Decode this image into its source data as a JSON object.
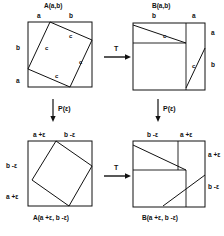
{
  "figure": {
    "title": "",
    "stroke_color": "#111111",
    "background": "#ffffff"
  },
  "panels": [
    {
      "id": "top-left",
      "caption": "A(a,b)",
      "caption_position": "above",
      "edge_labels": [
        {
          "text": "a",
          "side": "top-left"
        },
        {
          "text": "b",
          "side": "top-right"
        },
        {
          "text": "b",
          "side": "left-upper"
        },
        {
          "text": "a",
          "side": "left-lower"
        }
      ],
      "inner_labels": [
        {
          "text": "c"
        },
        {
          "text": "c"
        },
        {
          "text": "c"
        },
        {
          "text": "c"
        }
      ],
      "shape": "square-with-inscribed-tilted-square"
    },
    {
      "id": "top-right",
      "caption": "B(a,b)",
      "caption_position": "above",
      "edge_labels": [
        {
          "text": "b",
          "side": "top-left"
        },
        {
          "text": "a",
          "side": "top-right"
        },
        {
          "text": "a",
          "side": "right-upper"
        },
        {
          "text": "b",
          "side": "right-lower"
        }
      ],
      "inner_labels": [
        {
          "text": "c"
        },
        {
          "text": "c"
        }
      ],
      "shape": "square-with-two-right-triangles"
    },
    {
      "id": "bottom-left",
      "caption": "A(a +ε, b -ε)",
      "caption_position": "below",
      "edge_labels": [
        {
          "text": "a +ε",
          "side": "top-left"
        },
        {
          "text": "b -ε",
          "side": "top-right"
        },
        {
          "text": "b -ε",
          "side": "left-upper"
        },
        {
          "text": "a +ε",
          "side": "left-lower"
        }
      ],
      "inner_labels": [],
      "shape": "square-with-inscribed-tilted-square"
    },
    {
      "id": "bottom-right",
      "caption": "B(a +ε, b -ε)",
      "caption_position": "below",
      "edge_labels": [
        {
          "text": "b -ε",
          "side": "top-left"
        },
        {
          "text": "a +ε",
          "side": "top-right"
        },
        {
          "text": "a +ε",
          "side": "right-upper"
        },
        {
          "text": "b -ε",
          "side": "right-lower"
        }
      ],
      "inner_labels": [],
      "shape": "square-with-two-right-triangles"
    }
  ],
  "arrows": [
    {
      "id": "arrow-top-horizontal",
      "label": "T",
      "direction": "right"
    },
    {
      "id": "arrow-bottom-horizontal",
      "label": "T",
      "direction": "right"
    },
    {
      "id": "arrow-left-vertical",
      "label": "P(ε)",
      "direction": "down"
    },
    {
      "id": "arrow-right-vertical",
      "label": "P(ε)",
      "direction": "down"
    }
  ]
}
